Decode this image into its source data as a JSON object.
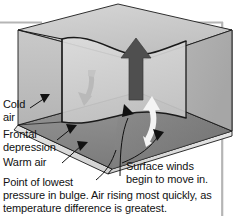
{
  "figure": {
    "labels": {
      "cold_air": "Cold\nair",
      "frontal_depression": "Frontal\ndepression",
      "warm_air": "Warm air",
      "surface_winds": "Surface winds\nbegin to move in."
    },
    "caption": {
      "line1": "Point of lowest",
      "rest": "pressure in bulge. Air rising most quickly, as\ntemperature difference is greatest."
    },
    "icons": {
      "rising_air_arrow": "up-arrow-icon",
      "descending_air_arrow": "curved-down-arrow-icon",
      "inflow_arrow": "curved-up-arrow-icon",
      "pointer_cold": "pointer-arrow-icon",
      "pointer_front": "pointer-arrow-icon",
      "pointer_warm": "pointer-arrow-icon",
      "pointer_surface": "pointer-arrow-icon",
      "pointer_bulge": "pointer-arrow-icon"
    },
    "colors": {
      "background": "#ffffff",
      "top_surface": "#c8c8c8",
      "front_face": "#bdbdbd",
      "right_face": "#b0b0b0",
      "interior_wall": "#d2d2d2",
      "ground_plane": "#8c8c8c",
      "ground_plane_right": "#7a7a7a",
      "slab_edge": "#dcdcdc",
      "outline": "#1a1a1a",
      "dark_arrow": "#4a4a4a",
      "white_arrow": "#f2f2f2",
      "grey_arrow": "#b8b8b8",
      "frame_line": "#b5b5b5",
      "text": "#111111"
    }
  }
}
